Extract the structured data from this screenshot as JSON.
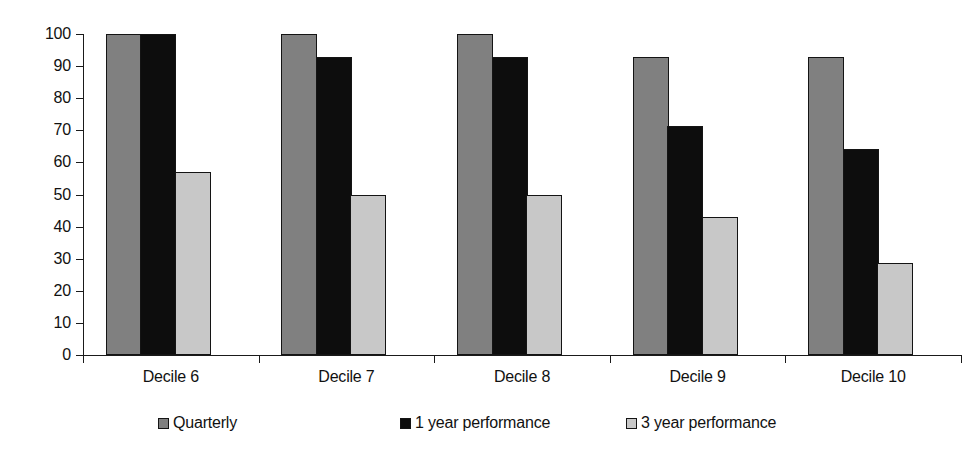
{
  "chart_data": {
    "type": "bar",
    "title": "",
    "subtitle": "",
    "xlabel": "",
    "ylabel": "",
    "categories": [
      "Decile 6",
      "Decile 7",
      "Decile 8",
      "Decile 9",
      "Decile 10"
    ],
    "series": [
      {
        "name": "Quarterly",
        "color": "#808080",
        "values": [
          100,
          100,
          100,
          92.9,
          92.9
        ]
      },
      {
        "name": "1 year performance",
        "color": "#0d0d0d",
        "values": [
          100,
          92.9,
          92.9,
          71.4,
          64.3
        ]
      },
      {
        "name": "3 year performance",
        "color": "#c8c8c8",
        "values": [
          57.1,
          50,
          50,
          42.9,
          28.6
        ]
      }
    ],
    "ylim": [
      0,
      100
    ],
    "yticks": [
      0,
      10,
      20,
      30,
      40,
      50,
      60,
      70,
      80,
      90,
      100
    ],
    "ytick_labels": [
      "0",
      "10",
      "20",
      "30",
      "40",
      "50",
      "60",
      "70",
      "80",
      "90",
      "100"
    ],
    "grid": false,
    "legend_position": "bottom",
    "bar_border_color": "#141414"
  }
}
